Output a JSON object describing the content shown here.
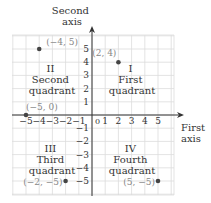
{
  "diagram": {
    "type": "cartesian-coordinate-plane",
    "x_axis_label": [
      "First",
      "axis"
    ],
    "y_axis_label": [
      "Second",
      "axis"
    ],
    "x_ticks": [
      -5,
      -4,
      -3,
      -2,
      -1,
      1,
      2,
      3,
      4,
      5
    ],
    "x_tick_labels": [
      "−5",
      "−4",
      "−3",
      "−2",
      "−1",
      "1",
      "2",
      "3",
      "4",
      "5"
    ],
    "y_ticks": [
      5,
      4,
      3,
      2,
      1,
      -1,
      -2,
      -3,
      -4,
      -5
    ],
    "y_tick_labels": [
      "5",
      "4",
      "3",
      "2",
      "1",
      "−1",
      "−2",
      "−3",
      "−4",
      "−5"
    ],
    "origin_label": "0",
    "quadrants": [
      {
        "numeral": "I",
        "name": "First",
        "word": "quadrant"
      },
      {
        "numeral": "II",
        "name": "Second",
        "word": "quadrant"
      },
      {
        "numeral": "III",
        "name": "Third",
        "word": "quadrant"
      },
      {
        "numeral": "IV",
        "name": "Fourth",
        "word": "quadrant"
      }
    ],
    "points": [
      {
        "x": -4,
        "y": 5,
        "label": "(−4, 5)"
      },
      {
        "x": 2,
        "y": 4,
        "label": "(2, 4)"
      },
      {
        "x": -5,
        "y": 0,
        "label": "(−5, 0)"
      },
      {
        "x": -2,
        "y": -5,
        "label": "(−2, −5)"
      },
      {
        "x": 5,
        "y": -5,
        "label": "(5, −5)"
      }
    ],
    "colors": {
      "grid": "#dcdcdc",
      "axis": "#333333",
      "point": "#444444",
      "point_label": "#888888",
      "text": "#333333"
    }
  }
}
